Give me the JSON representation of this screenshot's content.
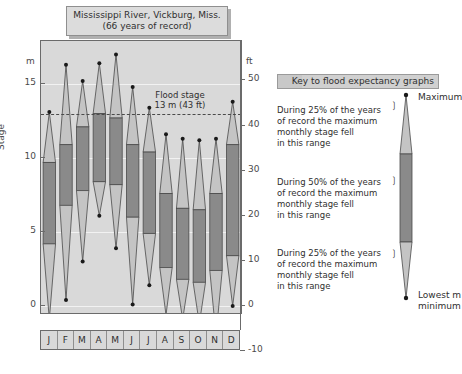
{
  "title": {
    "line1": "Mississippi River, Vickburg, Miss.",
    "line2": "(66 years of record)"
  },
  "axes": {
    "left_unit": "m",
    "right_unit": "ft",
    "y_axis_title": "Stage",
    "left_ticks": [
      "15",
      "10",
      "5",
      "0"
    ],
    "right_ticks": [
      "50",
      "40",
      "30",
      "20",
      "10",
      "0",
      "-10"
    ]
  },
  "annotations": {
    "flood_stage_line1": "Flood stage",
    "flood_stage_line2": "13 m (43 ft)"
  },
  "legend": {
    "header": "Key to flood expectancy graphs",
    "top_label": "Maximum",
    "bottom_label_line1": "Lowest m",
    "bottom_label_line2": "minimum",
    "block_upper": "During 25% of the years of record the maximum monthly stage fell in this range",
    "block_middle": "During 50% of the years of record the maximum monthly stage fell in this range",
    "block_lower": "During 25% of the years of record the maximum monthly stage fell in this range",
    "block_upper_lines": [
      "During 25% of the years",
      "of record the maximum",
      "monthly stage fell",
      "in this range"
    ],
    "block_middle_lines": [
      "During 50% of the years",
      "of record the maximum",
      "monthly stage fell",
      "in this range"
    ],
    "block_lower_lines": [
      "During 25% of the years",
      "of record the maximum",
      "monthly stage fell",
      "in this range"
    ]
  },
  "colors": {
    "plot_background": "#d9d9d9",
    "light_band": "#c4c4c4",
    "dark_band": "#8a8a8a",
    "outline": "#4a4a4a",
    "gridline": "#f2f2f2",
    "plaque": "#dcdcdc",
    "text": "#2f2f2f"
  },
  "chart_data": {
    "type": "box",
    "title": "Mississippi River, Vickburg, Miss. (66 years of record)",
    "subtitle": "66 years of record",
    "xlabel": "",
    "ylabel": "Stage",
    "y_unit_left": "m",
    "y_unit_right": "ft",
    "ylim_m": [
      -2.5,
      18.0
    ],
    "ylim_ft": [
      -12,
      55
    ],
    "grid": true,
    "legend_position": "right",
    "flood_stage_m": 13,
    "flood_stage_ft": 43,
    "categories": [
      "J",
      "F",
      "M",
      "A",
      "M",
      "J",
      "J",
      "A",
      "S",
      "O",
      "N",
      "D"
    ],
    "month_names": [
      "January",
      "February",
      "March",
      "April",
      "May",
      "June",
      "July",
      "August",
      "September",
      "October",
      "November",
      "December"
    ],
    "series_description": "Maximum monthly stage distribution: minimum, 25th percentile, 75th percentile, maximum (m)",
    "boxes": [
      {
        "month": "J",
        "min": -0.9,
        "q1": 4.2,
        "q3": 9.7,
        "max": 13.1
      },
      {
        "month": "F",
        "min": 0.4,
        "q1": 6.8,
        "q3": 10.9,
        "max": 16.3
      },
      {
        "month": "M",
        "min": 3.0,
        "q1": 7.8,
        "q3": 12.1,
        "max": 15.2
      },
      {
        "month": "A",
        "min": 6.1,
        "q1": 8.4,
        "q3": 13.0,
        "max": 16.4
      },
      {
        "month": "M",
        "min": 3.9,
        "q1": 8.2,
        "q3": 12.7,
        "max": 17.0
      },
      {
        "month": "J",
        "min": 0.1,
        "q1": 6.0,
        "q3": 10.9,
        "max": 14.8
      },
      {
        "month": "J",
        "min": 1.4,
        "q1": 4.9,
        "q3": 10.4,
        "max": 13.4
      },
      {
        "month": "A",
        "min": -0.6,
        "q1": 2.6,
        "q3": 7.6,
        "max": 11.6
      },
      {
        "month": "S",
        "min": -0.9,
        "q1": 1.8,
        "q3": 6.6,
        "max": 11.3
      },
      {
        "month": "O",
        "min": -1.2,
        "q1": 1.6,
        "q3": 6.5,
        "max": 11.2
      },
      {
        "month": "N",
        "min": -2.0,
        "q1": 2.4,
        "q3": 7.6,
        "max": 11.3
      },
      {
        "month": "D",
        "min": 0.0,
        "q1": 3.4,
        "q3": 10.9,
        "max": 13.8
      }
    ]
  }
}
